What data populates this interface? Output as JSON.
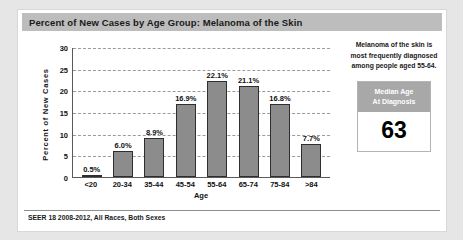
{
  "title": "Percent of New Cases by Age Group: Melanoma of the Skin",
  "footer": "SEER 18 2008-2012, All Races, Both Sexes",
  "side_panel": {
    "description": "Melanoma of the skin is most frequently diagnosed among people aged 55-64.",
    "median_box": {
      "header_line1": "Median Age",
      "header_line2": "At Diagnosis",
      "value": "63"
    }
  },
  "colors": {
    "title_bar": "#bdbdbd",
    "bar_fill": "#8c8c8c",
    "bar_border": "#2e2e2e",
    "box_header": "#a8a8a8",
    "gridline": "#9a9a9a",
    "axis": "#5a5a5a",
    "card": "#ffffff",
    "page_background": "#e6e6e6"
  },
  "chart_data": {
    "type": "bar",
    "title": "Percent of New Cases by Age Group: Melanoma of the Skin",
    "xlabel": "Age",
    "ylabel": "Percent of New Cases",
    "categories": [
      "<20",
      "20-34",
      "35-44",
      "45-54",
      "55-64",
      "65-74",
      "75-84",
      ">84"
    ],
    "values": [
      0.5,
      6.0,
      8.9,
      16.9,
      22.1,
      21.1,
      16.8,
      7.7
    ],
    "data_labels": [
      "0.5%",
      "6.0%",
      "8.9%",
      "16.9%",
      "22.1%",
      "21.1%",
      "16.8%",
      "7.7%"
    ],
    "ylim": [
      0,
      30
    ],
    "yticks": [
      0,
      5,
      10,
      15,
      20,
      25,
      30
    ],
    "ytick_labels": [
      "0",
      "5",
      "10",
      "15",
      "20",
      "25",
      "30"
    ],
    "grid": true,
    "grid_style": "dashed-horizontal",
    "legend": false
  }
}
